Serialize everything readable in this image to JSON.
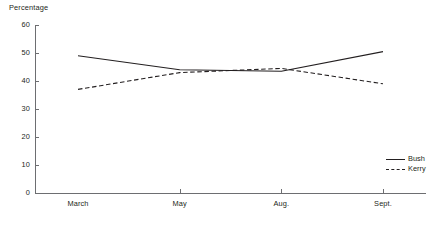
{
  "chart_data": {
    "type": "line",
    "title": "",
    "ylabel": "Percentage",
    "xlabel": "",
    "categories": [
      "March",
      "May",
      "Aug.",
      "Sept."
    ],
    "ylim": [
      0,
      60
    ],
    "ytick_labels": [
      "60",
      "50",
      "40",
      "30",
      "20",
      "10",
      "0"
    ],
    "ytick_values": [
      60,
      50,
      40,
      30,
      20,
      10,
      0
    ],
    "grid": false,
    "legend_position": "right-lower",
    "series": [
      {
        "name": "Bush",
        "style": "solid",
        "color": "#231f20",
        "values": [
          49,
          44,
          43.5,
          50.5
        ]
      },
      {
        "name": "Kerry",
        "style": "dashed",
        "color": "#231f20",
        "values": [
          37,
          43,
          44.5,
          39
        ]
      }
    ]
  },
  "legend": {
    "entries": [
      {
        "label": "Bush"
      },
      {
        "label": "Kerry"
      }
    ]
  },
  "colors": {
    "axis": "#6d6e71",
    "line": "#231f20",
    "background": "#ffffff"
  }
}
